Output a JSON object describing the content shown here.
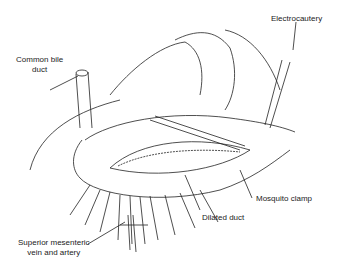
{
  "figure": {
    "labels": {
      "common_bile_duct_line1": "Common bile",
      "common_bile_duct_line2": "duct",
      "electrocautery": "Electrocautery",
      "mosquito_clamp": "Mosquito clamp",
      "dilated_duct": "Dilated duct",
      "smv_line1": "Superior mesenteric",
      "smv_line2": "vein and artery"
    }
  }
}
